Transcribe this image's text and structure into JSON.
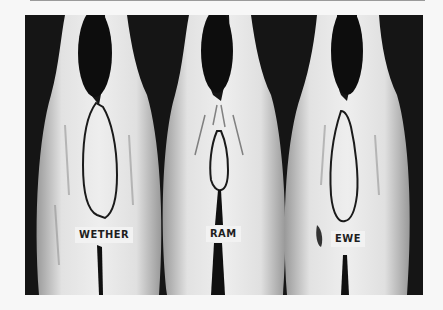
{
  "image": {
    "description": "Black-and-white photograph of three lamb carcasses viewed from the rear, each with the loin region outlined",
    "background_color": "#151515",
    "carcasses": [
      {
        "label": "WETHER"
      },
      {
        "label": "RAM"
      },
      {
        "label": "EWE"
      }
    ]
  }
}
